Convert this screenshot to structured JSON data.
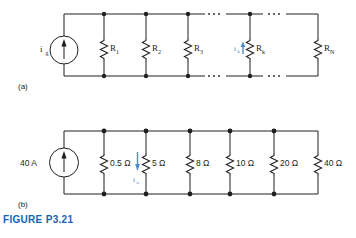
{
  "figure": {
    "caption": "FIGURE P3.21",
    "caption_color": "#1565b0",
    "background": "#ffffff",
    "line_color": "#231f20",
    "accent_color": "#4a8ccc"
  },
  "panel_a": {
    "tag": "(a)",
    "source": {
      "label": "i",
      "label_sub": "g",
      "type": "current-source",
      "arrow_direction": "up"
    },
    "branches": [
      {
        "label": "R",
        "label_sub": "1"
      },
      {
        "label": "R",
        "label_sub": "2"
      },
      {
        "label": "R",
        "label_sub": "3"
      },
      {
        "label": "R",
        "label_sub": "k"
      },
      {
        "label": "R",
        "label_sub": "N"
      }
    ],
    "branch_current": {
      "label": "i",
      "label_sub": "k",
      "arrow_direction": "up",
      "color": "#4a8ccc"
    },
    "ellipsis_count": 2
  },
  "panel_b": {
    "tag": "(b)",
    "source": {
      "label": "40 A",
      "type": "current-source",
      "arrow_direction": "up"
    },
    "branches": [
      {
        "label": "0.5 Ω"
      },
      {
        "label": "5 Ω"
      },
      {
        "label": "8 Ω"
      },
      {
        "label": "10 Ω"
      },
      {
        "label": "20 Ω"
      },
      {
        "label": "40 Ω"
      }
    ],
    "branch_current": {
      "label": "i",
      "label_sub": "o",
      "arrow_direction": "down",
      "color": "#4a8ccc"
    }
  }
}
